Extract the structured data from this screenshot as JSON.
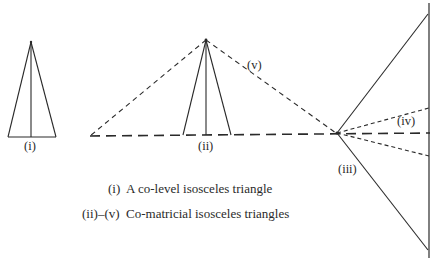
{
  "labels": {
    "i": "(i)",
    "ii": "(ii)",
    "iii": "(iii)",
    "iv": "(iv)",
    "v": "(v)"
  },
  "caption": {
    "line1_key": "(i)",
    "line1_text": "A co-level isosceles triangle",
    "line2_key": "(ii)–(v)",
    "line2_text": "Co-matricial isosceles triangles"
  },
  "colors": {
    "stroke": "#2a2a2a",
    "background": "#ffffff"
  }
}
